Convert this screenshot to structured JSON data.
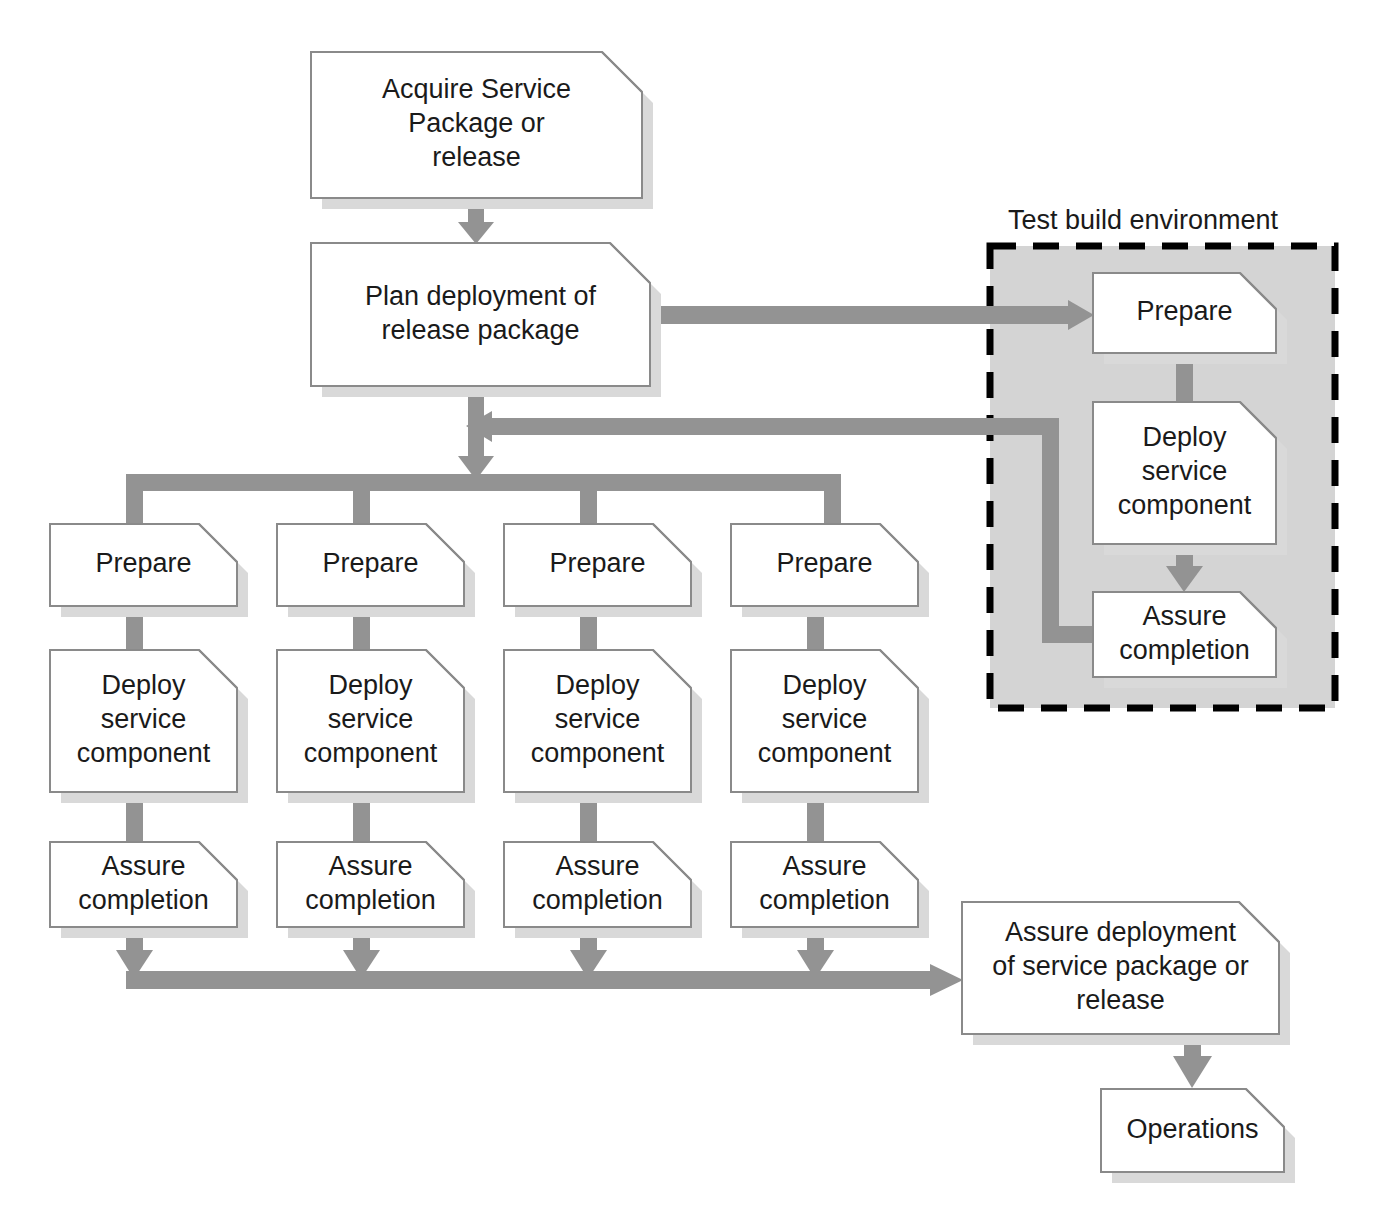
{
  "diagram": {
    "colors": {
      "node_fill": "#ffffff",
      "node_stroke": "#8a8a8a",
      "node_shadow": "#d9d9d9",
      "connector": "#939393",
      "group_fill": "#d4d4d4",
      "group_stroke": "#000000",
      "text": "#1a1a1a",
      "background": "#ffffff"
    },
    "groups": [
      {
        "id": "test-build-environment",
        "label": "Test build environment",
        "label_x": 1143,
        "label_y": 222,
        "x": 990,
        "y": 246,
        "width": 345,
        "height": 462
      }
    ],
    "nodes": [
      {
        "id": "acquire-service-package",
        "lines": [
          "Acquire Service",
          "Package or",
          "release"
        ],
        "x": 311,
        "y": 52,
        "width": 331,
        "height": 146,
        "chamfer": 40
      },
      {
        "id": "plan-deployment",
        "lines": [
          "Plan deployment of",
          "release package"
        ],
        "x": 311,
        "y": 243,
        "width": 339,
        "height": 143,
        "chamfer": 40
      },
      {
        "id": "test-prepare",
        "lines": [
          "Prepare"
        ],
        "x": 1093,
        "y": 273,
        "width": 183,
        "height": 80,
        "chamfer": 36
      },
      {
        "id": "test-deploy-service-component",
        "lines": [
          "Deploy",
          "service",
          "component"
        ],
        "x": 1093,
        "y": 402,
        "width": 183,
        "height": 142,
        "chamfer": 36
      },
      {
        "id": "test-assure-completion",
        "lines": [
          "Assure",
          "completion"
        ],
        "x": 1093,
        "y": 592,
        "width": 183,
        "height": 85,
        "chamfer": 36
      },
      {
        "id": "prepare-1",
        "lines": [
          "Prepare"
        ],
        "x": 50,
        "y": 524,
        "width": 187,
        "height": 82,
        "chamfer": 38
      },
      {
        "id": "prepare-2",
        "lines": [
          "Prepare"
        ],
        "x": 277,
        "y": 524,
        "width": 187,
        "height": 82,
        "chamfer": 38
      },
      {
        "id": "prepare-3",
        "lines": [
          "Prepare"
        ],
        "x": 504,
        "y": 524,
        "width": 187,
        "height": 82,
        "chamfer": 38
      },
      {
        "id": "prepare-4",
        "lines": [
          "Prepare"
        ],
        "x": 731,
        "y": 524,
        "width": 187,
        "height": 82,
        "chamfer": 38
      },
      {
        "id": "deploy-service-component-1",
        "lines": [
          "Deploy",
          "service",
          "component"
        ],
        "x": 50,
        "y": 650,
        "width": 187,
        "height": 142,
        "chamfer": 38
      },
      {
        "id": "deploy-service-component-2",
        "lines": [
          "Deploy",
          "service",
          "component"
        ],
        "x": 277,
        "y": 650,
        "width": 187,
        "height": 142,
        "chamfer": 38
      },
      {
        "id": "deploy-service-component-3",
        "lines": [
          "Deploy",
          "service",
          "component"
        ],
        "x": 504,
        "y": 650,
        "width": 187,
        "height": 142,
        "chamfer": 38
      },
      {
        "id": "deploy-service-component-4",
        "lines": [
          "Deploy",
          "service",
          "component"
        ],
        "x": 731,
        "y": 650,
        "width": 187,
        "height": 142,
        "chamfer": 38
      },
      {
        "id": "assure-completion-1",
        "lines": [
          "Assure",
          "completion"
        ],
        "x": 50,
        "y": 842,
        "width": 187,
        "height": 85,
        "chamfer": 38
      },
      {
        "id": "assure-completion-2",
        "lines": [
          "Assure",
          "completion"
        ],
        "x": 277,
        "y": 842,
        "width": 187,
        "height": 85,
        "chamfer": 38
      },
      {
        "id": "assure-completion-3",
        "lines": [
          "Assure",
          "completion"
        ],
        "x": 504,
        "y": 842,
        "width": 187,
        "height": 85,
        "chamfer": 38
      },
      {
        "id": "assure-completion-4",
        "lines": [
          "Assure",
          "completion"
        ],
        "x": 731,
        "y": 842,
        "width": 187,
        "height": 85,
        "chamfer": 38
      },
      {
        "id": "assure-deployment",
        "lines": [
          "Assure deployment",
          "of service package or",
          "release"
        ],
        "x": 962,
        "y": 902,
        "width": 317,
        "height": 132,
        "chamfer": 40
      },
      {
        "id": "operations",
        "lines": [
          "Operations"
        ],
        "x": 1101,
        "y": 1089,
        "width": 183,
        "height": 83,
        "chamfer": 38
      }
    ],
    "connectors": [
      {
        "id": "acquire-to-plan",
        "kind": "arrow-down"
      },
      {
        "id": "plan-to-test-prepare",
        "kind": "arrow-right"
      },
      {
        "id": "test-prepare-to-test-deploy",
        "kind": "bar-down"
      },
      {
        "id": "test-deploy-to-test-assure",
        "kind": "arrow-down"
      },
      {
        "id": "test-assure-return-to-main",
        "kind": "arrow-left-elbow"
      },
      {
        "id": "plan-to-distribution-bus",
        "kind": "arrow-down"
      },
      {
        "id": "distribution-bus",
        "kind": "bus-horizontal"
      },
      {
        "id": "bus-drop-1",
        "kind": "bar-down"
      },
      {
        "id": "bus-drop-2",
        "kind": "bar-down"
      },
      {
        "id": "bus-drop-3",
        "kind": "bar-down"
      },
      {
        "id": "bus-drop-4",
        "kind": "bar-down"
      },
      {
        "id": "prepare-to-deploy-1",
        "kind": "bar-down"
      },
      {
        "id": "prepare-to-deploy-2",
        "kind": "bar-down"
      },
      {
        "id": "prepare-to-deploy-3",
        "kind": "bar-down"
      },
      {
        "id": "prepare-to-deploy-4",
        "kind": "bar-down"
      },
      {
        "id": "deploy-to-assure-1",
        "kind": "bar-down"
      },
      {
        "id": "deploy-to-assure-2",
        "kind": "bar-down"
      },
      {
        "id": "deploy-to-assure-3",
        "kind": "bar-down"
      },
      {
        "id": "deploy-to-assure-4",
        "kind": "bar-down"
      },
      {
        "id": "assure-drop-1",
        "kind": "arrow-down"
      },
      {
        "id": "assure-drop-2",
        "kind": "arrow-down"
      },
      {
        "id": "assure-drop-3",
        "kind": "arrow-down"
      },
      {
        "id": "assure-drop-4",
        "kind": "arrow-down"
      },
      {
        "id": "collector-bus-to-assure-deployment",
        "kind": "arrow-right"
      },
      {
        "id": "assure-deployment-to-operations",
        "kind": "arrow-down"
      }
    ]
  }
}
